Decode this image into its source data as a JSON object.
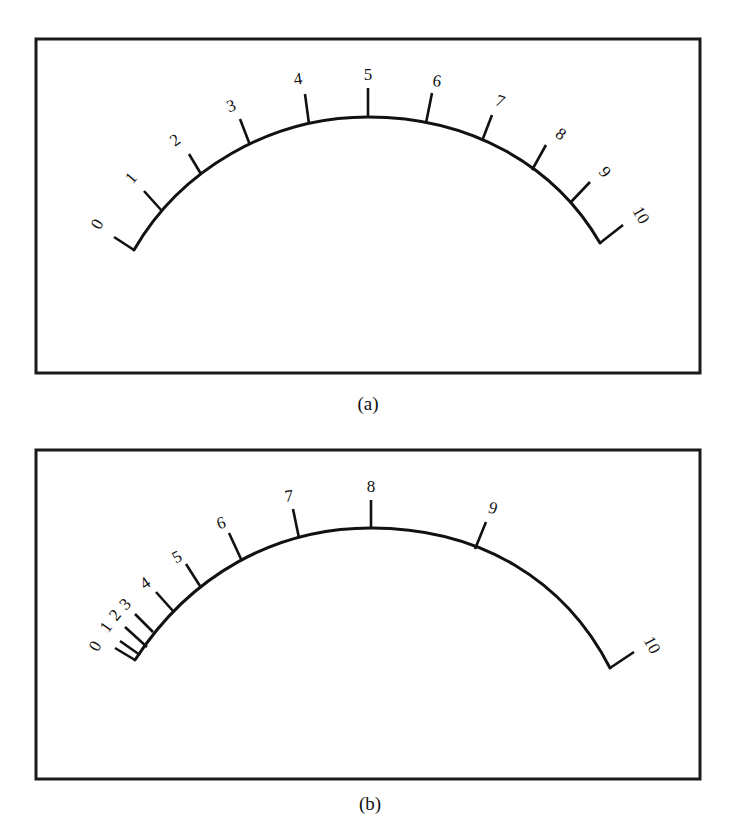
{
  "figure": {
    "panels": [
      {
        "id": "a",
        "caption": "(a)",
        "frame": {
          "x": 36,
          "y": 39,
          "w": 664,
          "h": 334
        },
        "caption_pos": {
          "x": 368,
          "y": 410
        },
        "arc_path": "M134,250 C180,170 270,117 368,117 C470,117 555,165 600,243",
        "ticks": [
          {
            "label": "0",
            "base": [
              134,
              250
            ],
            "tip": [
              114,
              237
            ],
            "lx": 97,
            "ly": 224,
            "rot": -60
          },
          {
            "label": "1",
            "base": [
              162,
              211
            ],
            "tip": [
              144,
              191
            ],
            "lx": 131,
            "ly": 178,
            "rot": -50
          },
          {
            "label": "2",
            "base": [
              201,
              174
            ],
            "tip": [
              189,
              154
            ],
            "lx": 175,
            "ly": 140,
            "rot": -35
          },
          {
            "label": "3",
            "base": [
              250,
              145
            ],
            "tip": [
              240,
              119
            ],
            "lx": 231,
            "ly": 106,
            "rot": -20
          },
          {
            "label": "4",
            "base": [
              309,
              124
            ],
            "tip": [
              305,
              94
            ],
            "lx": 298,
            "ly": 79,
            "rot": -8
          },
          {
            "label": "5",
            "base": [
              368,
              117
            ],
            "tip": [
              368,
              88
            ],
            "lx": 368,
            "ly": 74,
            "rot": 0
          },
          {
            "label": "6",
            "base": [
              426,
              123
            ],
            "tip": [
              432,
              93
            ],
            "lx": 437,
            "ly": 81,
            "rot": 8
          },
          {
            "label": "7",
            "base": [
              482,
              141
            ],
            "tip": [
              492,
              115
            ],
            "lx": 500,
            "ly": 101,
            "rot": 20
          },
          {
            "label": "8",
            "base": [
              532,
              170
            ],
            "tip": [
              546,
              145
            ],
            "lx": 561,
            "ly": 134,
            "rot": 35
          },
          {
            "label": "9",
            "base": [
              570,
              203
            ],
            "tip": [
              590,
              182
            ],
            "lx": 605,
            "ly": 172,
            "rot": 50
          },
          {
            "label": "10",
            "base": [
              600,
              243
            ],
            "tip": [
              623,
              225
            ],
            "lx": 641,
            "ly": 215,
            "rot": 60
          }
        ]
      },
      {
        "id": "b",
        "caption": "(b)",
        "frame": {
          "x": 36,
          "y": 450,
          "w": 664,
          "h": 329
        },
        "caption_pos": {
          "x": 370,
          "y": 810
        },
        "arc_path": "M135,660 C190,575 275,528 371,528 C480,528 565,580 610,668",
        "ticks": [
          {
            "label": "0",
            "base": [
              135,
              660
            ],
            "tip": [
              115,
              648
            ],
            "lx": 95,
            "ly": 646,
            "rot": -60
          },
          {
            "label": "1",
            "base": [
              140,
              655
            ],
            "tip": [
              120,
              641
            ],
            "lx": 106,
            "ly": 627,
            "rot": -55
          },
          {
            "label": "2",
            "base": [
              147,
              647
            ],
            "tip": [
              125,
              627
            ],
            "lx": 115,
            "ly": 615,
            "rot": -50
          },
          {
            "label": "3",
            "base": [
              153,
              632
            ],
            "tip": [
              135,
              614
            ],
            "lx": 125,
            "ly": 604,
            "rot": -45
          },
          {
            "label": "4",
            "base": [
              173,
              611
            ],
            "tip": [
              156,
              592
            ],
            "lx": 145,
            "ly": 583,
            "rot": -35
          },
          {
            "label": "5",
            "base": [
              200,
              586
            ],
            "tip": [
              186,
              564
            ],
            "lx": 177,
            "ly": 557,
            "rot": -28
          },
          {
            "label": "6",
            "base": [
              241,
              559
            ],
            "tip": [
              229,
              533
            ],
            "lx": 221,
            "ly": 523,
            "rot": -18
          },
          {
            "label": "7",
            "base": [
              299,
              538
            ],
            "tip": [
              293,
              509
            ],
            "lx": 289,
            "ly": 496,
            "rot": -6
          },
          {
            "label": "8",
            "base": [
              371,
              528
            ],
            "tip": [
              371,
              500
            ],
            "lx": 371,
            "ly": 486,
            "rot": 0
          },
          {
            "label": "9",
            "base": [
              475,
              549
            ],
            "tip": [
              486,
              522
            ],
            "lx": 493,
            "ly": 508,
            "rot": 15
          },
          {
            "label": "10",
            "base": [
              610,
              668
            ],
            "tip": [
              634,
              652
            ],
            "lx": 652,
            "ly": 645,
            "rot": 62
          }
        ]
      }
    ]
  },
  "colors": {
    "ink": "#111111",
    "background": "#ffffff"
  }
}
